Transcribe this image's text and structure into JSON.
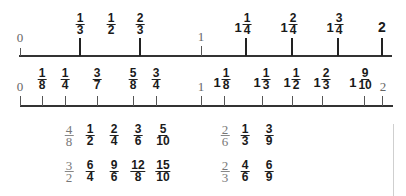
{
  "number_line_1": {
    "start_label": "0",
    "mid_label": "1",
    "marks": [
      {
        "type": "fraction",
        "num": "1",
        "den": "3"
      },
      {
        "type": "fraction",
        "num": "1",
        "den": "2"
      },
      {
        "type": "fraction",
        "num": "2",
        "den": "3"
      },
      {
        "type": "mixed",
        "whole": "1",
        "num": "1",
        "den": "4"
      },
      {
        "type": "mixed",
        "whole": "1",
        "num": "2",
        "den": "4"
      },
      {
        "type": "mixed",
        "whole": "1",
        "num": "3",
        "den": "4"
      },
      {
        "type": "whole",
        "value": "2"
      }
    ]
  },
  "number_line_2": {
    "start_label": "0",
    "mid_label": "1",
    "end_label": "2",
    "marks": [
      {
        "type": "fraction",
        "num": "1",
        "den": "8"
      },
      {
        "type": "fraction",
        "num": "1",
        "den": "4"
      },
      {
        "type": "fraction",
        "num": "3",
        "den": "7"
      },
      {
        "type": "fraction",
        "num": "5",
        "den": "8"
      },
      {
        "type": "fraction",
        "num": "3",
        "den": "4"
      },
      {
        "type": "mixed",
        "whole": "1",
        "num": "1",
        "den": "8"
      },
      {
        "type": "mixed",
        "whole": "1",
        "num": "1",
        "den": "3"
      },
      {
        "type": "mixed",
        "whole": "1",
        "num": "1",
        "den": "2"
      },
      {
        "type": "mixed",
        "whole": "1",
        "num": "2",
        "den": "3"
      },
      {
        "type": "mixed",
        "whole": "1",
        "num": "9",
        "den": "10"
      }
    ]
  },
  "equivalent_groups": [
    {
      "row": 1,
      "left": {
        "key": {
          "num": "4",
          "den": "8"
        },
        "items": [
          {
            "num": "1",
            "den": "2"
          },
          {
            "num": "2",
            "den": "4"
          },
          {
            "num": "3",
            "den": "6"
          },
          {
            "num": "5",
            "den": "10"
          }
        ]
      },
      "right": {
        "key": {
          "num": "2",
          "den": "6"
        },
        "items": [
          {
            "num": "1",
            "den": "3"
          },
          {
            "num": "3",
            "den": "9"
          }
        ]
      }
    },
    {
      "row": 2,
      "left": {
        "key": {
          "num": "3",
          "den": "2"
        },
        "items": [
          {
            "num": "6",
            "den": "4"
          },
          {
            "num": "9",
            "den": "6"
          },
          {
            "num": "12",
            "den": "8"
          },
          {
            "num": "15",
            "den": "10"
          }
        ]
      },
      "right": {
        "key": {
          "num": "2",
          "den": "3"
        },
        "items": [
          {
            "num": "4",
            "den": "6"
          },
          {
            "num": "6",
            "den": "9"
          }
        ]
      }
    }
  ]
}
